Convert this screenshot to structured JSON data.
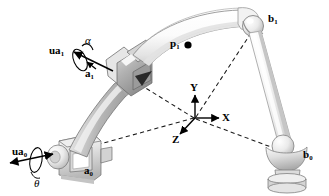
{
  "figure": {
    "type": "technical-line-drawing",
    "background_color": "#ffffff",
    "ink_color": "#000000",
    "body_fill_light": "#f4f4f4",
    "body_fill_mid": "#c9c9c9",
    "body_fill_dark": "#9a9a9a",
    "outline_color": "#7d7d7d"
  },
  "labels": {
    "ua1": {
      "base": "ua",
      "sub": "1"
    },
    "alpha": {
      "text": "α"
    },
    "a1": {
      "base": "a",
      "sub": "1"
    },
    "p1": {
      "base": "p",
      "sub": "1"
    },
    "b1": {
      "base": "b",
      "sub": "1"
    },
    "ua0": {
      "base": "ua",
      "sub": "0"
    },
    "theta": {
      "text": "θ"
    },
    "a0": {
      "base": "a",
      "sub": "0"
    },
    "b0": {
      "base": "b",
      "sub": "0"
    }
  },
  "frame": {
    "name": "reference-coordinate-frame",
    "origin": {
      "x": 195,
      "y": 118
    },
    "axes": [
      {
        "name": "x-axis",
        "label": "X",
        "dir": "right",
        "tip": {
          "x": 221,
          "y": 118
        }
      },
      {
        "name": "y-axis",
        "label": "Y",
        "dir": "up",
        "tip": {
          "x": 195,
          "y": 93
        }
      },
      {
        "name": "z-axis",
        "label": "Z",
        "dir": "down-left",
        "tip": {
          "x": 178,
          "y": 137
        }
      }
    ]
  },
  "points": {
    "a0": {
      "x": 56,
      "y": 158,
      "role": "lower-base-revolute-joint"
    },
    "a1": {
      "x": 128,
      "y": 78,
      "role": "mid-universal-joint"
    },
    "p1": {
      "x": 183,
      "y": 45,
      "role": "point-on-upper-arm"
    },
    "b1": {
      "x": 259,
      "y": 25,
      "role": "upper-spherical-joint"
    },
    "b0": {
      "x": 284,
      "y": 156,
      "role": "lower-spherical-joint-base"
    }
  },
  "dashed_lines": [
    {
      "name": "origin-to-a1",
      "from": "origin",
      "to": "a1"
    },
    {
      "name": "origin-to-a0",
      "from": "origin",
      "to": "a0"
    },
    {
      "name": "origin-to-b1",
      "from": "origin",
      "to": "b1"
    },
    {
      "name": "origin-to-b0",
      "from": "origin",
      "to": "b0"
    }
  ],
  "vectors": [
    {
      "name": "ua1-axis-vector",
      "label": "ua1",
      "angle_label": "alpha",
      "style": "arrow-with-rotation-ellipse"
    },
    {
      "name": "ua0-axis-vector",
      "label": "ua0",
      "angle_label": "theta",
      "style": "double-arrow-with-rotation-ellipse"
    }
  ]
}
